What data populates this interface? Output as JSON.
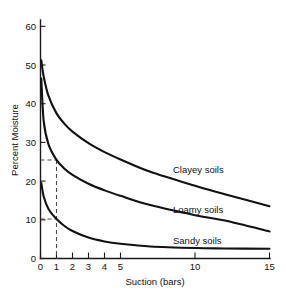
{
  "chart_data": {
    "type": "line",
    "title": "",
    "subtitle": "",
    "xlabel": "Suction (bars)",
    "ylabel": "Percent Moisture",
    "xlim": [
      0,
      15
    ],
    "ylim": [
      0,
      60
    ],
    "grid": false,
    "legend_position": "inline-right-of-curve",
    "x_scale_note": "compressed: 0-5 linear, 5-15 compressed",
    "xticks": [
      0,
      1,
      2,
      3,
      4,
      5,
      10,
      15
    ],
    "xticklabels": [
      "0",
      "1",
      "2",
      "3",
      "4",
      "5",
      "10",
      "15"
    ],
    "yticks": [
      0,
      10,
      20,
      30,
      40,
      50,
      60
    ],
    "yticklabels": [
      "0",
      "10",
      "20",
      "30",
      "40",
      "50",
      "60"
    ],
    "x": [
      0.05,
      0.2,
      0.5,
      1,
      1.5,
      2,
      3,
      4,
      5,
      7,
      10,
      12,
      15
    ],
    "series": [
      {
        "name": "Clayey soils",
        "label": "Clayey soils",
        "color": "#111111",
        "values": [
          51.2,
          47.0,
          42.0,
          37.5,
          34.8,
          32.8,
          29.8,
          27.5,
          25.6,
          22.4,
          18.8,
          16.6,
          13.5
        ],
        "label_x": 8.6,
        "label_y": 22.0
      },
      {
        "name": "Loamy soils",
        "label": "Loamy soils",
        "color": "#111111",
        "values": [
          46.5,
          35.5,
          29.5,
          25.5,
          23.2,
          21.6,
          19.3,
          17.6,
          16.2,
          13.8,
          11.2,
          9.8,
          7.0
        ],
        "label_x": 8.6,
        "label_y": 12.8
      },
      {
        "name": "Sandy soils",
        "label": "Sandy soils",
        "color": "#111111",
        "values": [
          19.5,
          16.0,
          12.8,
          10.2,
          8.4,
          7.1,
          5.4,
          4.4,
          3.8,
          3.1,
          2.7,
          2.6,
          2.5
        ]
      }
    ],
    "sandy_label_x": 8.6,
    "sandy_label_y": 4.6,
    "annotations": [
      {
        "name": "suction-1-bar-reference",
        "type": "dashed-guide",
        "x": 1,
        "y_values": [
          25.5,
          10.2
        ],
        "description": "vertical dashed line at 1 bar with horizontal dashed ties to loamy (25.5%) and sandy (10.2%) curves"
      }
    ]
  },
  "axes": {
    "x_title": "Suction (bars)",
    "y_title": "Percent Moisture"
  }
}
